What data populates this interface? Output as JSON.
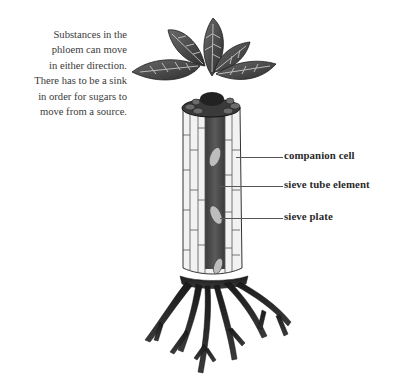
{
  "caption": {
    "lines": [
      "Substances in the",
      "phloem can move",
      "in either direction.",
      "There has to be a sink",
      "in order for sugars to",
      "move from a source."
    ]
  },
  "labels": [
    {
      "text": "companion cell",
      "target": "companion-cell"
    },
    {
      "text": "sieve tube element",
      "target": "sieve-tube-element"
    },
    {
      "text": "sieve plate",
      "target": "sieve-plate"
    }
  ],
  "figure": {
    "parts": [
      "leaves",
      "phloem tissue column",
      "roots"
    ]
  }
}
